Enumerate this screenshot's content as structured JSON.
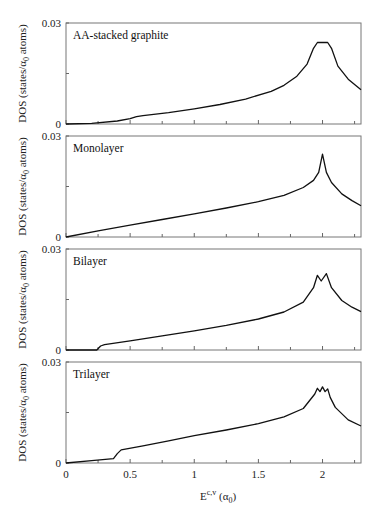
{
  "chart_data": {
    "type": "line",
    "layout": "4 vertically stacked panels sharing x-axis",
    "xlabel": "E^{c,v} (α0)",
    "ylabel": "DOS (states/α0 atoms)",
    "xlim": [
      0,
      2.3
    ],
    "ylim": [
      0,
      0.03
    ],
    "x_ticks": [
      "0",
      "0.5",
      "1",
      "1.5",
      "2"
    ],
    "y_ticks": [
      "0",
      "0.03"
    ],
    "grid": false,
    "legend": null,
    "panels": [
      {
        "name": "AA-stacked graphite",
        "x": [
          0,
          0.2,
          0.4,
          0.5,
          0.55,
          0.6,
          0.8,
          1.0,
          1.2,
          1.4,
          1.6,
          1.7,
          1.8,
          1.88,
          1.93,
          1.96,
          2.04,
          2.07,
          2.12,
          2.2,
          2.3
        ],
        "y": [
          0,
          0.0002,
          0.0009,
          0.0016,
          0.0022,
          0.0025,
          0.0034,
          0.0045,
          0.0058,
          0.0074,
          0.0097,
          0.0115,
          0.0142,
          0.0178,
          0.0225,
          0.0242,
          0.0242,
          0.0225,
          0.0172,
          0.0133,
          0.0102
        ]
      },
      {
        "name": "Monolayer",
        "x": [
          0,
          0.25,
          0.5,
          0.75,
          1.0,
          1.25,
          1.5,
          1.7,
          1.85,
          1.93,
          1.97,
          2.0,
          2.03,
          2.07,
          2.15,
          2.23,
          2.3
        ],
        "y": [
          0,
          0.0018,
          0.0035,
          0.0052,
          0.0069,
          0.0086,
          0.0105,
          0.0124,
          0.0147,
          0.0168,
          0.0192,
          0.0246,
          0.0192,
          0.0162,
          0.0128,
          0.0108,
          0.0093
        ]
      },
      {
        "name": "Bilayer",
        "x": [
          0,
          0.24,
          0.27,
          0.3,
          0.5,
          0.75,
          1.0,
          1.25,
          1.5,
          1.7,
          1.85,
          1.93,
          1.96,
          1.99,
          2.03,
          2.07,
          2.15,
          2.23,
          2.3
        ],
        "y": [
          0,
          0,
          0.0012,
          0.0016,
          0.0027,
          0.0042,
          0.0057,
          0.0073,
          0.0092,
          0.0113,
          0.0142,
          0.0185,
          0.0222,
          0.0205,
          0.0227,
          0.0185,
          0.0147,
          0.0127,
          0.0114
        ]
      },
      {
        "name": "Trilayer",
        "x": [
          0,
          0.2,
          0.37,
          0.4,
          0.43,
          0.6,
          0.8,
          1.0,
          1.25,
          1.5,
          1.7,
          1.85,
          1.94,
          1.96,
          1.98,
          2.0,
          2.02,
          2.04,
          2.06,
          2.1,
          2.2,
          2.3
        ],
        "y": [
          0,
          0.0007,
          0.0013,
          0.0028,
          0.0039,
          0.0051,
          0.0066,
          0.0081,
          0.0098,
          0.0117,
          0.0137,
          0.0162,
          0.0205,
          0.0222,
          0.0212,
          0.0226,
          0.0212,
          0.022,
          0.0195,
          0.0165,
          0.0128,
          0.011
        ]
      }
    ]
  },
  "figure": {
    "ylabel_text": "DOS (states/α",
    "ylabel_sub": "0",
    "ylabel_tail": " atoms)",
    "xlabel_main": "E",
    "xlabel_sup": "c,v",
    "xlabel_paren_open": " (α",
    "xlabel_sub": "0",
    "xlabel_paren_close": ")",
    "y_top_label": "0.03",
    "y_bottom_label": "0",
    "panel_labels": [
      "AA-stacked graphite",
      "Monolayer",
      "Bilayer",
      "Trilayer"
    ],
    "x_tick_labels": [
      "0",
      "0.5",
      "1",
      "1.5",
      "2"
    ]
  }
}
